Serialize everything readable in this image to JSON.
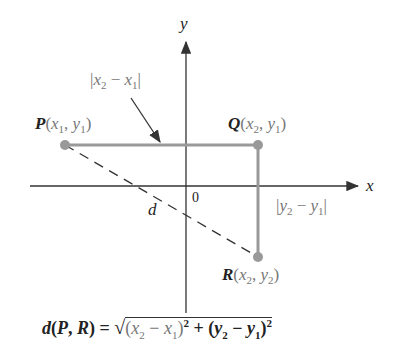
{
  "diagram": {
    "axes": {
      "x_label": "x",
      "y_label": "y",
      "origin_label": "0"
    },
    "points": [
      {
        "name": "P",
        "coords": "(x1, y1)",
        "x": 65,
        "y": 145
      },
      {
        "name": "Q",
        "coords": "(x2, y1)",
        "x": 258,
        "y": 145
      },
      {
        "name": "R",
        "coords": "(x2, y2)",
        "x": 258,
        "y": 257
      }
    ],
    "labels": {
      "horizontal_distance": "|x2 − x1|",
      "vertical_distance": "|y2 − y1|",
      "distance": "d",
      "formula": "d(P, R) = √((x2 − x1)² + (y2 − y1)²)"
    },
    "colors": {
      "segment": "#999999",
      "axes": "#333333",
      "point": "#999999"
    }
  }
}
